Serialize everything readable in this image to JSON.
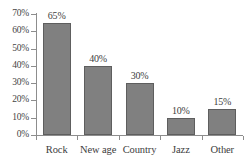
{
  "chart_data": {
    "type": "bar",
    "title": "",
    "subtitle": "",
    "xlabel": "",
    "ylabel": "",
    "categories": [
      "Rock",
      "New age",
      "Country",
      "Jazz",
      "Other"
    ],
    "values": [
      65,
      40,
      30,
      10,
      15
    ],
    "data_labels": [
      "65%",
      "40%",
      "30%",
      "10%",
      "15%"
    ],
    "ytick_labels": [
      "0%",
      "10%",
      "20%",
      "30%",
      "40%",
      "50%",
      "60%",
      "70%"
    ],
    "ytick_values": [
      0,
      10,
      20,
      30,
      40,
      50,
      60,
      70
    ],
    "ylim": [
      0,
      70
    ],
    "grid": false,
    "legend": false,
    "legend_position": "none",
    "bar_color": "#808080",
    "bar_border_color": "#5e5e5e",
    "axis_color": "#8d8d8d",
    "text_color": "#3d3d3d",
    "background_color": "#ffffff",
    "units": "percent"
  }
}
